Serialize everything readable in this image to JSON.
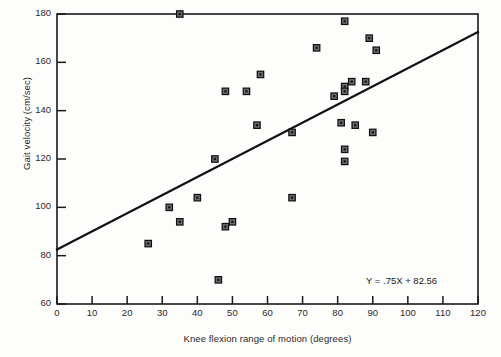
{
  "chart_data": {
    "type": "scatter",
    "title": "",
    "xlabel": "Knee flexion range of motion (degrees)",
    "ylabel": "Gait velocity (cm/sec)",
    "xlim": [
      0,
      120
    ],
    "ylim": [
      60,
      180
    ],
    "xticks": [
      0,
      10,
      20,
      30,
      40,
      50,
      60,
      70,
      80,
      90,
      100,
      110,
      120
    ],
    "yticks": [
      60,
      80,
      100,
      120,
      140,
      160,
      180
    ],
    "grid": false,
    "legend": null,
    "annotations": [
      {
        "text": "Y = .75X + 82.56",
        "x": 104,
        "y": 69
      }
    ],
    "regression": {
      "equation": "Y = .75X + 82.56",
      "slope": 0.75,
      "intercept": 82.56,
      "x_start": 0,
      "y_start": 82.56,
      "x_end": 120,
      "y_end": 172.56
    },
    "marker": "square-with-center-dot",
    "series": [
      {
        "name": "Subjects",
        "n": 32,
        "points": [
          {
            "x": 35,
            "y": 180
          },
          {
            "x": 82,
            "y": 177
          },
          {
            "x": 89,
            "y": 170
          },
          {
            "x": 74,
            "y": 166
          },
          {
            "x": 91,
            "y": 165
          },
          {
            "x": 58,
            "y": 155
          },
          {
            "x": 48,
            "y": 148
          },
          {
            "x": 54,
            "y": 148
          },
          {
            "x": 84,
            "y": 152
          },
          {
            "x": 88,
            "y": 152
          },
          {
            "x": 82,
            "y": 150
          },
          {
            "x": 82,
            "y": 148
          },
          {
            "x": 79,
            "y": 146
          },
          {
            "x": 57,
            "y": 134
          },
          {
            "x": 81,
            "y": 135
          },
          {
            "x": 85,
            "y": 134
          },
          {
            "x": 67,
            "y": 131
          },
          {
            "x": 90,
            "y": 131
          },
          {
            "x": 82,
            "y": 124
          },
          {
            "x": 45,
            "y": 120
          },
          {
            "x": 82,
            "y": 119
          },
          {
            "x": 67,
            "y": 104
          },
          {
            "x": 40,
            "y": 104
          },
          {
            "x": 32,
            "y": 100
          },
          {
            "x": 35,
            "y": 94
          },
          {
            "x": 50,
            "y": 94
          },
          {
            "x": 48,
            "y": 92
          },
          {
            "x": 26,
            "y": 85
          },
          {
            "x": 46,
            "y": 70
          }
        ]
      }
    ]
  },
  "axes": {
    "x_label": "Knee flexion range of motion (degrees)",
    "y_label": "Gait velocity (cm/sec)",
    "x_ticks": [
      "0",
      "10",
      "20",
      "30",
      "40",
      "50",
      "60",
      "70",
      "80",
      "90",
      "100",
      "110",
      "120"
    ],
    "y_ticks": [
      "180",
      "160",
      "140",
      "120",
      "100",
      "80",
      "60"
    ]
  },
  "equation_text": "Y = .75X + 82.56",
  "colors": {
    "axis": "#1a1a1a",
    "marker_fill": "#6d6d6d",
    "marker_stroke": "#111111",
    "marker_center": "#111111",
    "regression_line": "#111111",
    "background": "#fdfdfc"
  }
}
